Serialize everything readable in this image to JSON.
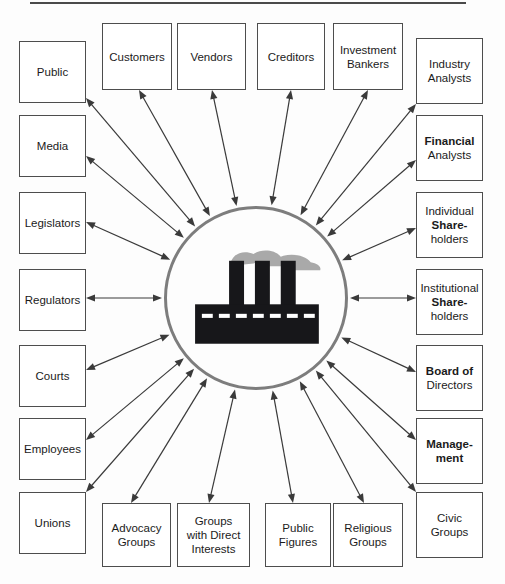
{
  "diagram": {
    "hub": {
      "icon": "factory-icon",
      "shape": "circle",
      "cx": 256,
      "cy": 298,
      "r": 92,
      "circle_color": "#7d7d7d",
      "factory_color": "#17171a",
      "smoke_color": "#a9a9a9"
    },
    "connector": {
      "style": "double-headed-arrow",
      "color": "#3a3a3a",
      "count": 20
    },
    "top_rule": {
      "color": "#4a4a4a"
    },
    "nodes": [
      {
        "id": "public",
        "lines": [
          {
            "t": "Public",
            "bold": false
          }
        ],
        "x": 19,
        "y": 41,
        "w": 67,
        "h": 62
      },
      {
        "id": "media",
        "lines": [
          {
            "t": "Media",
            "bold": false
          }
        ],
        "x": 19,
        "y": 115,
        "w": 67,
        "h": 62
      },
      {
        "id": "legislators",
        "lines": [
          {
            "t": "Legislators",
            "bold": false
          }
        ],
        "x": 19,
        "y": 192,
        "w": 67,
        "h": 62
      },
      {
        "id": "regulators",
        "lines": [
          {
            "t": "Regulators",
            "bold": false
          }
        ],
        "x": 19,
        "y": 269,
        "w": 67,
        "h": 62
      },
      {
        "id": "courts",
        "lines": [
          {
            "t": "Courts",
            "bold": false
          }
        ],
        "x": 19,
        "y": 345,
        "w": 67,
        "h": 62
      },
      {
        "id": "employees",
        "lines": [
          {
            "t": "Employees",
            "bold": false
          }
        ],
        "x": 19,
        "y": 418,
        "w": 67,
        "h": 62
      },
      {
        "id": "unions",
        "lines": [
          {
            "t": "Unions",
            "bold": false
          }
        ],
        "x": 19,
        "y": 492,
        "w": 67,
        "h": 62
      },
      {
        "id": "customers",
        "lines": [
          {
            "t": "Customers",
            "bold": false
          }
        ],
        "x": 102,
        "y": 23,
        "w": 70,
        "h": 67
      },
      {
        "id": "vendors",
        "lines": [
          {
            "t": "Vendors",
            "bold": false
          }
        ],
        "x": 177,
        "y": 23,
        "w": 69,
        "h": 67
      },
      {
        "id": "creditors",
        "lines": [
          {
            "t": "Creditors",
            "bold": false
          }
        ],
        "x": 257,
        "y": 23,
        "w": 68,
        "h": 67
      },
      {
        "id": "investment-bankers",
        "lines": [
          {
            "t": "Investment",
            "bold": false
          },
          {
            "t": "Bankers",
            "bold": false
          }
        ],
        "x": 333,
        "y": 23,
        "w": 70,
        "h": 67
      },
      {
        "id": "industry-analysts",
        "lines": [
          {
            "t": "Industry",
            "bold": false
          },
          {
            "t": "Analysts",
            "bold": false
          }
        ],
        "x": 416,
        "y": 38,
        "w": 67,
        "h": 66
      },
      {
        "id": "financial-analysts",
        "lines": [
          {
            "t": "Financial",
            "bold": true
          },
          {
            "t": "Analysts",
            "bold": false
          }
        ],
        "x": 416,
        "y": 115,
        "w": 67,
        "h": 66
      },
      {
        "id": "individual-shareholders",
        "lines": [
          {
            "t": "Individual",
            "bold": false
          },
          {
            "t": "Share-",
            "bold": true
          },
          {
            "t": "holders",
            "bold": false
          }
        ],
        "x": 416,
        "y": 192,
        "w": 67,
        "h": 66
      },
      {
        "id": "institutional-shareholders",
        "lines": [
          {
            "t": "Institutional",
            "bold": false
          },
          {
            "t": "Share-",
            "bold": true
          },
          {
            "t": "holders",
            "bold": false
          }
        ],
        "x": 416,
        "y": 269,
        "w": 67,
        "h": 66
      },
      {
        "id": "board-of-directors",
        "lines": [
          {
            "t": "Board of",
            "bold": true
          },
          {
            "t": "Directors",
            "bold": false
          }
        ],
        "x": 416,
        "y": 345,
        "w": 67,
        "h": 66
      },
      {
        "id": "management",
        "lines": [
          {
            "t": "Manage-",
            "bold": true
          },
          {
            "t": "ment",
            "bold": true
          }
        ],
        "x": 416,
        "y": 418,
        "w": 67,
        "h": 66
      },
      {
        "id": "civic-groups",
        "lines": [
          {
            "t": "Civic",
            "bold": false
          },
          {
            "t": "Groups",
            "bold": false
          }
        ],
        "x": 416,
        "y": 492,
        "w": 67,
        "h": 66
      },
      {
        "id": "advocacy-groups",
        "lines": [
          {
            "t": "Advocacy",
            "bold": false
          },
          {
            "t": "Groups",
            "bold": false
          }
        ],
        "x": 102,
        "y": 503,
        "w": 69,
        "h": 64
      },
      {
        "id": "groups-direct-interests",
        "lines": [
          {
            "t": "Groups",
            "bold": false
          },
          {
            "t": "with Direct",
            "bold": false
          },
          {
            "t": "Interests",
            "bold": false
          }
        ],
        "x": 177,
        "y": 503,
        "w": 73,
        "h": 64
      },
      {
        "id": "public-figures",
        "lines": [
          {
            "t": "Public",
            "bold": false
          },
          {
            "t": "Figures",
            "bold": false
          }
        ],
        "x": 265,
        "y": 503,
        "w": 66,
        "h": 64
      },
      {
        "id": "religious-groups",
        "lines": [
          {
            "t": "Religious",
            "bold": false
          },
          {
            "t": "Groups",
            "bold": false
          }
        ],
        "x": 333,
        "y": 503,
        "w": 70,
        "h": 64
      }
    ],
    "links": [
      {
        "node": "public",
        "ax": 86,
        "ay": 98,
        "side": "right"
      },
      {
        "node": "media",
        "ax": 86,
        "ay": 156,
        "side": "right"
      },
      {
        "node": "legislators",
        "ax": 86,
        "ay": 222,
        "side": "right"
      },
      {
        "node": "regulators",
        "ax": 86,
        "ay": 298,
        "side": "right"
      },
      {
        "node": "courts",
        "ax": 86,
        "ay": 370,
        "side": "right"
      },
      {
        "node": "employees",
        "ax": 86,
        "ay": 440,
        "side": "right"
      },
      {
        "node": "unions",
        "ax": 86,
        "ay": 492,
        "side": "right"
      },
      {
        "node": "customers",
        "ax": 139,
        "ay": 90,
        "side": "bottom"
      },
      {
        "node": "vendors",
        "ax": 212,
        "ay": 90,
        "side": "bottom"
      },
      {
        "node": "creditors",
        "ax": 291,
        "ay": 90,
        "side": "bottom"
      },
      {
        "node": "investment-bankers",
        "ax": 368,
        "ay": 90,
        "side": "bottom"
      },
      {
        "node": "industry-analysts",
        "ax": 416,
        "ay": 104,
        "side": "left"
      },
      {
        "node": "financial-analysts",
        "ax": 416,
        "ay": 160,
        "side": "left"
      },
      {
        "node": "individual-shareholders",
        "ax": 416,
        "ay": 228,
        "side": "left"
      },
      {
        "node": "institutional-shareholders",
        "ax": 416,
        "ay": 298,
        "side": "left"
      },
      {
        "node": "board-of-directors",
        "ax": 416,
        "ay": 372,
        "side": "left"
      },
      {
        "node": "management",
        "ax": 416,
        "ay": 440,
        "side": "left"
      },
      {
        "node": "civic-groups",
        "ax": 416,
        "ay": 492,
        "side": "left"
      },
      {
        "node": "advocacy-groups",
        "ax": 131,
        "ay": 503,
        "side": "top"
      },
      {
        "node": "groups-direct-interests",
        "ax": 209,
        "ay": 503,
        "side": "top"
      },
      {
        "node": "public-figures",
        "ax": 293,
        "ay": 503,
        "side": "top"
      },
      {
        "node": "religious-groups",
        "ax": 364,
        "ay": 503,
        "side": "top"
      }
    ]
  }
}
